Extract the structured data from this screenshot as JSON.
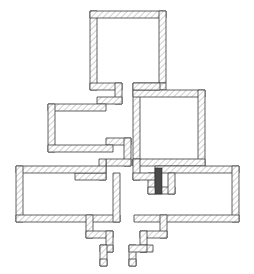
{
  "document": {
    "type": "architectural-floor-plan",
    "title": "Floor Plan",
    "width": 254,
    "height": 274,
    "background_color": "#ffffff"
  },
  "style": {
    "wall_outline_color": "#3a3a3a",
    "wall_hatch_color": "#9a9a9a",
    "wall_fill_color": "#fdfdfd",
    "wall_outline_width": 0.8,
    "wall_hatch_angle_deg": 45,
    "wall_hatch_spacing": 3,
    "wall_thickness": 7,
    "interior_fill_color": "#ffffff",
    "door_fill_color": "#4a4a4a"
  },
  "plan": {
    "outer_outline_label": "building-envelope",
    "wall_polygon_outer": "90,11 166,11 166,83 187,83 187,97 205,97 205,166 239,166 239,222 160,222 160,238 147,238 147,252 137,252 137,266 122,266 122,238 113,238 113,252 100,252 100,266 86,266 86,238 75,238 75,222 16,222 16,166 62,166 62,152 48,152 48,104 97,104 97,90 90,90",
    "rooms": [
      {
        "name": "top-room",
        "outer": {
          "x": 90,
          "y": 11,
          "w": 76,
          "h": 79
        },
        "inner": {
          "x": 97,
          "y": 18,
          "w": 62,
          "h": 72
        }
      },
      {
        "name": "left-middle-room",
        "outer": {
          "x": 48,
          "y": 104,
          "w": 72,
          "h": 48
        },
        "inner": {
          "x": 55,
          "y": 111,
          "w": 58,
          "h": 34
        }
      },
      {
        "name": "right-middle-room",
        "outer": {
          "x": 133,
          "y": 83,
          "w": 72,
          "h": 83
        },
        "inner": {
          "x": 140,
          "y": 90,
          "w": 58,
          "h": 69
        }
      },
      {
        "name": "bottom-left-room",
        "outer": {
          "x": 16,
          "y": 166,
          "w": 104,
          "h": 56
        },
        "inner": {
          "x": 23,
          "y": 173,
          "w": 90,
          "h": 42
        }
      },
      {
        "name": "bottom-right-room",
        "outer": {
          "x": 134,
          "y": 166,
          "w": 105,
          "h": 56
        },
        "inner": {
          "x": 141,
          "y": 173,
          "w": 91,
          "h": 42
        }
      }
    ],
    "protrusions": [
      {
        "name": "bottom-left-stair-protrusion",
        "steps": 2,
        "direction": "down-right"
      },
      {
        "name": "bottom-right-stair-protrusion",
        "steps": 2,
        "direction": "down-left"
      }
    ],
    "openings": [
      {
        "name": "door-element",
        "kind": "door-leaf",
        "fill": "#4a4a4a",
        "x": 155,
        "y": 168,
        "w": 7,
        "h": 26
      }
    ]
  },
  "labels": {
    "none_visible": ""
  }
}
